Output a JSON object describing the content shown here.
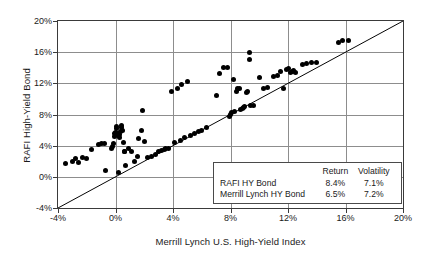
{
  "chart_data": {
    "type": "scatter",
    "title": "",
    "xlabel": "Merrill Lynch U.S. High-Yield Index",
    "ylabel": "RAFI High-Yield Bond",
    "xlim": [
      -4,
      20
    ],
    "ylim": [
      -4,
      20
    ],
    "xticks": [
      "-4%",
      "0%",
      "4%",
      "8%",
      "12%",
      "16%",
      "20%"
    ],
    "yticks": [
      "-4%",
      "0%",
      "4%",
      "8%",
      "12%",
      "16%",
      "20%"
    ],
    "xtick_values": [
      -4,
      0,
      4,
      8,
      12,
      16,
      20
    ],
    "ytick_values": [
      -4,
      0,
      4,
      8,
      12,
      16,
      20
    ],
    "grid": true,
    "legend_position": "inside-lower-right",
    "reference_line": {
      "name": "45-degree identity line",
      "from": [
        -4,
        -4
      ],
      "to": [
        20,
        20
      ]
    },
    "point_color": "#000000",
    "points": [
      [
        -3.5,
        1.7
      ],
      [
        -3.0,
        2.0
      ],
      [
        -2.8,
        2.3
      ],
      [
        -2.6,
        1.9
      ],
      [
        -2.3,
        2.5
      ],
      [
        -2.0,
        2.4
      ],
      [
        -1.7,
        3.5
      ],
      [
        -1.2,
        4.2
      ],
      [
        -1.0,
        4.3
      ],
      [
        -0.8,
        4.3
      ],
      [
        -0.7,
        0.8
      ],
      [
        -0.3,
        3.6
      ],
      [
        -0.2,
        3.9
      ],
      [
        -0.15,
        4.3
      ],
      [
        -0.1,
        5.2
      ],
      [
        -0.05,
        5.5
      ],
      [
        0.0,
        5.7
      ],
      [
        0.05,
        6.2
      ],
      [
        0.1,
        6.5
      ],
      [
        0.15,
        5.6
      ],
      [
        0.2,
        5.3
      ],
      [
        0.25,
        5.0
      ],
      [
        0.3,
        5.4
      ],
      [
        0.35,
        5.8
      ],
      [
        0.4,
        6.3
      ],
      [
        0.45,
        6.6
      ],
      [
        0.5,
        6.0
      ],
      [
        0.55,
        4.4
      ],
      [
        0.6,
        3.2
      ],
      [
        0.65,
        3.3
      ],
      [
        0.2,
        0.5
      ],
      [
        0.7,
        1.5
      ],
      [
        0.9,
        3.6
      ],
      [
        1.1,
        3.2
      ],
      [
        1.3,
        2.0
      ],
      [
        1.5,
        2.6
      ],
      [
        1.6,
        4.9
      ],
      [
        1.8,
        6.0
      ],
      [
        1.9,
        8.5
      ],
      [
        2.0,
        4.5
      ],
      [
        2.2,
        2.5
      ],
      [
        2.5,
        2.6
      ],
      [
        2.8,
        2.9
      ],
      [
        3.0,
        3.2
      ],
      [
        3.2,
        3.4
      ],
      [
        3.4,
        3.5
      ],
      [
        3.5,
        3.6
      ],
      [
        3.7,
        3.7
      ],
      [
        3.9,
        10.9
      ],
      [
        4.1,
        4.4
      ],
      [
        4.3,
        11.4
      ],
      [
        4.5,
        4.7
      ],
      [
        4.6,
        11.8
      ],
      [
        4.8,
        5.0
      ],
      [
        5.0,
        12.2
      ],
      [
        5.2,
        5.3
      ],
      [
        5.5,
        5.5
      ],
      [
        5.8,
        5.8
      ],
      [
        6.0,
        6.0
      ],
      [
        6.3,
        6.3
      ],
      [
        7.0,
        10.5
      ],
      [
        7.2,
        13.2
      ],
      [
        7.5,
        14.0
      ],
      [
        7.8,
        14.0
      ],
      [
        7.9,
        7.8
      ],
      [
        8.0,
        8.0
      ],
      [
        8.1,
        8.2
      ],
      [
        8.2,
        12.5
      ],
      [
        8.3,
        8.4
      ],
      [
        8.4,
        11.0
      ],
      [
        8.5,
        11.4
      ],
      [
        8.6,
        11.3
      ],
      [
        8.7,
        8.6
      ],
      [
        8.8,
        8.8
      ],
      [
        8.9,
        8.9
      ],
      [
        9.0,
        9.0
      ],
      [
        9.1,
        10.8
      ],
      [
        9.2,
        11.0
      ],
      [
        9.3,
        15.1
      ],
      [
        9.35,
        15.9
      ],
      [
        9.4,
        9.2
      ],
      [
        9.6,
        9.2
      ],
      [
        10.0,
        12.8
      ],
      [
        10.3,
        11.3
      ],
      [
        10.6,
        11.5
      ],
      [
        11.0,
        12.9
      ],
      [
        11.3,
        13.0
      ],
      [
        11.5,
        13.5
      ],
      [
        11.7,
        11.3
      ],
      [
        11.9,
        13.8
      ],
      [
        12.0,
        13.9
      ],
      [
        12.2,
        13.4
      ],
      [
        12.3,
        13.5
      ],
      [
        12.4,
        13.6
      ],
      [
        12.5,
        13.4
      ],
      [
        13.0,
        14.4
      ],
      [
        13.3,
        14.6
      ],
      [
        13.6,
        14.7
      ],
      [
        14.0,
        14.7
      ],
      [
        15.5,
        17.2
      ],
      [
        15.8,
        17.5
      ],
      [
        16.2,
        17.5
      ]
    ]
  },
  "legend": {
    "headers": [
      "",
      "Return",
      "Volatility"
    ],
    "rows": [
      {
        "name": "RAFI HY Bond",
        "return": "8.4%",
        "volatility": "7.1%"
      },
      {
        "name": "Merrill Lynch HY Bond",
        "return": "6.5%",
        "volatility": "7.2%"
      }
    ]
  }
}
